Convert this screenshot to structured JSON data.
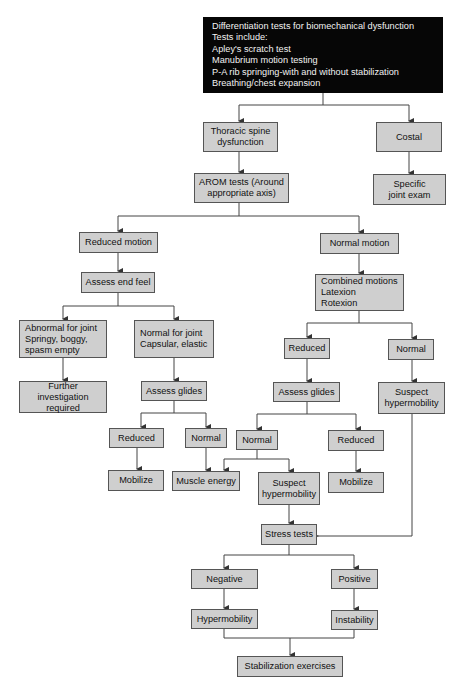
{
  "flowchart": {
    "colors": {
      "box_fill": "#cfcfcf",
      "box_border": "#555555",
      "header_fill": "#060606",
      "header_text": "#f2f2f2",
      "line": "#444444"
    },
    "header": {
      "title": "Differentiation tests for biomechanical dysfunction",
      "lines": [
        "Tests include:",
        "Apley's scratch test",
        "Manubrium motion testing",
        "P-A rib springing-with and without stabilization",
        "Breathing/chest expansion"
      ]
    },
    "nodes": {
      "thoracic": "Thoracic spine\ndysfunction",
      "costal": "Costal",
      "specific_joint": "Specific\njoint exam",
      "arom": "AROM tests (Around\nappropriate axis)",
      "reduced_motion": "Reduced motion",
      "normal_motion": "Normal motion",
      "assess_end_feel": "Assess end feel",
      "combined": "Combined motions\nLatexion\nRotexion",
      "abnormal_joint": "Abnormal for joint\nSpringy, boggy,\nspasm empty",
      "normal_joint": "Normal for joint\nCapsular, elastic",
      "further_investigation": "Further investigation\nrequired",
      "assess_glides_left": "Assess glides",
      "reduced_left": "Reduced",
      "normal_left": "Normal",
      "mobilize_left": "Mobilize",
      "muscle_energy": "Muscle energy",
      "reduced_combined": "Reduced",
      "normal_combined": "Normal",
      "assess_glides_mid": "Assess glides",
      "suspect_hyper_right": "Suspect\nhypermobility",
      "normal_mid": "Normal",
      "reduced_mid": "Reduced",
      "suspect_hyper_mid": "Suspect\nhypermobility",
      "mobilize_mid": "Mobilize",
      "stress_tests": "Stress tests",
      "negative": "Negative",
      "positive": "Positive",
      "hypermobility": "Hypermobility",
      "instability": "Instability",
      "stabilization": "Stabilization exercises"
    }
  }
}
